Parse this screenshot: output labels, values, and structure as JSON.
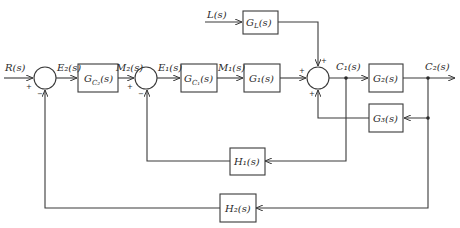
{
  "diagram": {
    "title": "",
    "signals": {
      "input": "R(s)",
      "error_outer": "E₂(s)",
      "manip_outer": "M₂(s)",
      "error_inner": "E₁(s)",
      "manip_inner": "M₁(s)",
      "load": "L(s)",
      "output_inner": "C₁(s)",
      "output_outer": "C₂(s)"
    },
    "blocks": {
      "gc2": {
        "name": "G",
        "sub": "C₂",
        "arg": "(s)"
      },
      "gc1": {
        "name": "G",
        "sub": "C₁",
        "arg": "(s)"
      },
      "g1": "G₁(s)",
      "gl": {
        "name": "G",
        "sub": "L",
        "arg": "(s)"
      },
      "g2": "G₂(s)",
      "g3": "G₃(s)",
      "h1": "H₁(s)",
      "h2": "H₂(s)"
    },
    "summing_junctions": [
      {
        "id": "sum1",
        "signs": {
          "left": "+",
          "bottom": "−"
        }
      },
      {
        "id": "sum2",
        "signs": {
          "left": "+",
          "bottom": "−"
        }
      },
      {
        "id": "sum3",
        "signs": {
          "left": "+",
          "top": "+",
          "bottom": "+"
        }
      }
    ]
  }
}
